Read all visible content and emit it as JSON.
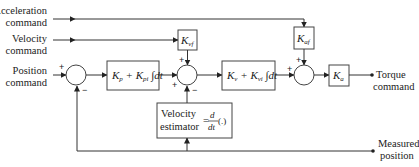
{
  "diagram": {
    "type": "control-block-diagram",
    "inputs": {
      "acceleration": [
        "Acceleration",
        "command"
      ],
      "velocity": [
        "Velocity",
        "command"
      ],
      "position": [
        "Position",
        "command"
      ]
    },
    "outputs": {
      "torque": [
        "Torque",
        "command"
      ],
      "measured": [
        "Measured",
        "position"
      ]
    },
    "blocks": {
      "position_pi": {
        "main": "K",
        "sub1": "p",
        "plus": " + K",
        "sub2": "pi",
        "tail": " ∫dt"
      },
      "velocity_pi": {
        "main": "K",
        "sub1": "v",
        "plus": " + K",
        "sub2": "vi",
        "tail": " ∫dt"
      },
      "kvf": {
        "main": "K",
        "sub": "vf"
      },
      "kaf": {
        "main": "K",
        "sub": "af"
      },
      "ka": {
        "main": "K",
        "sub": "a"
      },
      "velocity_estimator": {
        "line1": "Velocity",
        "line2": "estimator",
        "eq": "=",
        "num": "d",
        "den": "dt",
        "arg": "(.)"
      }
    },
    "signs": {
      "sum1_top": "+",
      "sum1_bottom": "−",
      "sum2_top": "+",
      "sum2_left": "+",
      "sum2_bottom": "−",
      "sum3_top": "+",
      "sum3_left": "+"
    }
  }
}
